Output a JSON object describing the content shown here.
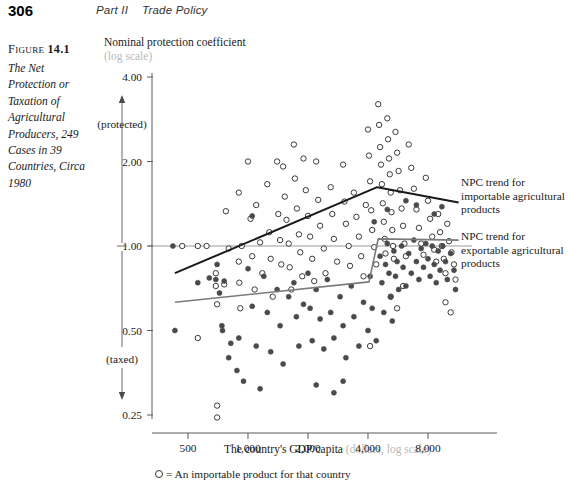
{
  "header": {
    "page_number": "306",
    "part": "Part II",
    "section": "Trade Policy"
  },
  "figure": {
    "label_prefix": "Figure",
    "label_number": "14.1",
    "caption": "The Net Protection or Taxation of Agricultural Producers, 249 Cases in 39 Countries, Circa 1980"
  },
  "annotations": {
    "importable_trend": "NPC trend for importable agricultural products",
    "exportable_trend": "NPC trend for exportable agricultural products"
  },
  "legend": {
    "marker": "open-circle",
    "text": "= An importable product for that country"
  },
  "axis_direction": {
    "top_label": "(protected)",
    "bottom_label": "(taxed)"
  },
  "chart_data": {
    "type": "scatter",
    "title": "The Net Protection or Taxation of Agricultural Producers, 249 Cases in 39 Countries, Circa 1980",
    "xlabel": "The country's GDP/capita",
    "xlabel_sub": "(dollars, log scale)",
    "ylabel": "Nominal protection coefficient",
    "ylabel_sub": "(log scale)",
    "xscale": "log",
    "yscale": "log",
    "xlim": [
      330,
      13000
    ],
    "ylim": [
      0.22,
      4.3
    ],
    "xticks": [
      500,
      1000,
      2000,
      4000,
      8000
    ],
    "xticklabels": [
      "500",
      "1,000",
      "2,000",
      "4,000",
      "8,000"
    ],
    "yticks": [
      0.25,
      0.5,
      1.0,
      2.0,
      4.0
    ],
    "yticklabels": [
      "0.25",
      "0.50",
      "1.00",
      "2.00",
      "4.00"
    ],
    "grid": false,
    "reference_line_y": 1.0,
    "n_cases": 249,
    "n_countries": 39,
    "series": [
      {
        "name": "Importable product for that country",
        "marker": "open-circle",
        "color": "#3a3a3a",
        "points": [
          [
            468,
            1.0
          ],
          [
            560,
            1.0
          ],
          [
            620,
            1.0
          ],
          [
            690,
            0.72
          ],
          [
            690,
            0.8
          ],
          [
            700,
            0.62
          ],
          [
            760,
            0.73
          ],
          [
            775,
            1.33
          ],
          [
            560,
            0.47
          ],
          [
            700,
            0.27
          ],
          [
            800,
            0.98
          ],
          [
            900,
            1.55
          ],
          [
            900,
            0.88
          ],
          [
            905,
            0.74
          ],
          [
            915,
            0.6
          ],
          [
            930,
            1.0
          ],
          [
            1000,
            2.0
          ],
          [
            1030,
            1.25
          ],
          [
            1050,
            0.92
          ],
          [
            1080,
            0.7
          ],
          [
            1100,
            1.4
          ],
          [
            1150,
            1.03
          ],
          [
            1180,
            0.8
          ],
          [
            1250,
            1.66
          ],
          [
            1280,
            1.12
          ],
          [
            1300,
            0.9
          ],
          [
            1330,
            0.66
          ],
          [
            1400,
            2.0
          ],
          [
            1420,
            1.3
          ],
          [
            1450,
            1.05
          ],
          [
            1470,
            0.86
          ],
          [
            1500,
            1.92
          ],
          [
            1530,
            1.5
          ],
          [
            1560,
            1.24
          ],
          [
            1600,
            1.02
          ],
          [
            1620,
            0.84
          ],
          [
            1650,
            0.7
          ],
          [
            1700,
            2.3
          ],
          [
            1720,
            1.74
          ],
          [
            1760,
            1.36
          ],
          [
            1800,
            1.1
          ],
          [
            1830,
            0.95
          ],
          [
            1870,
            0.78
          ],
          [
            1900,
            2.05
          ],
          [
            1950,
            1.58
          ],
          [
            2000,
            1.28
          ],
          [
            2050,
            1.08
          ],
          [
            2100,
            0.9
          ],
          [
            2150,
            0.75
          ],
          [
            2200,
            2.0
          ],
          [
            2250,
            1.46
          ],
          [
            2300,
            1.18
          ],
          [
            2400,
            0.98
          ],
          [
            2450,
            0.8
          ],
          [
            2600,
            1.62
          ],
          [
            2650,
            1.3
          ],
          [
            2700,
            1.06
          ],
          [
            2800,
            0.88
          ],
          [
            3000,
            1.95
          ],
          [
            3050,
            1.44
          ],
          [
            3100,
            1.2
          ],
          [
            3200,
            1.0
          ],
          [
            3250,
            0.85
          ],
          [
            3400,
            1.55
          ],
          [
            3500,
            1.27
          ],
          [
            3600,
            1.08
          ],
          [
            3700,
            0.92
          ],
          [
            3800,
            0.78
          ],
          [
            3900,
            1.4
          ],
          [
            4000,
            2.6
          ],
          [
            4050,
            2.1
          ],
          [
            4100,
            1.7
          ],
          [
            4150,
            1.34
          ],
          [
            4200,
            1.14
          ],
          [
            4300,
            0.99
          ],
          [
            4400,
            0.86
          ],
          [
            4500,
            3.2
          ],
          [
            4550,
            2.7
          ],
          [
            4600,
            2.25
          ],
          [
            4650,
            1.95
          ],
          [
            4700,
            1.66
          ],
          [
            4750,
            1.42
          ],
          [
            4800,
            1.22
          ],
          [
            4850,
            1.06
          ],
          [
            4900,
            0.94
          ],
          [
            5000,
            2.85
          ],
          [
            5050,
            2.4
          ],
          [
            5100,
            2.05
          ],
          [
            5150,
            1.8
          ],
          [
            5200,
            1.55
          ],
          [
            5250,
            1.32
          ],
          [
            5300,
            1.14
          ],
          [
            5350,
            1.0
          ],
          [
            5400,
            0.9
          ],
          [
            5500,
            2.55
          ],
          [
            5600,
            2.15
          ],
          [
            5700,
            1.85
          ],
          [
            5800,
            1.58
          ],
          [
            5900,
            1.36
          ],
          [
            6000,
            1.18
          ],
          [
            6100,
            1.02
          ],
          [
            6200,
            0.92
          ],
          [
            6400,
            2.3
          ],
          [
            6600,
            1.9
          ],
          [
            6800,
            1.6
          ],
          [
            7000,
            1.35
          ],
          [
            7200,
            1.16
          ],
          [
            7400,
            1.02
          ],
          [
            7600,
            0.93
          ],
          [
            7800,
            1.75
          ],
          [
            8000,
            1.45
          ],
          [
            8200,
            1.25
          ],
          [
            8400,
            1.08
          ],
          [
            8600,
            0.97
          ],
          [
            8800,
            0.88
          ],
          [
            9000,
            1.3
          ],
          [
            9200,
            1.12
          ],
          [
            9400,
            1.0
          ],
          [
            9600,
            0.9
          ],
          [
            9800,
            0.8
          ],
          [
            10000,
            1.2
          ],
          [
            10200,
            1.04
          ],
          [
            10500,
            0.95
          ],
          [
            10800,
            0.86
          ],
          [
            11000,
            0.76
          ],
          [
            700,
            0.245
          ],
          [
            5200,
            0.66
          ],
          [
            5600,
            0.6
          ],
          [
            4100,
            0.44
          ],
          [
            6000,
            0.72
          ],
          [
            9800,
            0.63
          ],
          [
            10400,
            0.58
          ]
        ]
      },
      {
        "name": "Exportable product for that country",
        "marker": "filled-circle",
        "color": "#4a4a4a",
        "points": [
          [
            420,
            1.0
          ],
          [
            430,
            0.5
          ],
          [
            560,
            0.74
          ],
          [
            640,
            0.77
          ],
          [
            690,
            0.76
          ],
          [
            700,
            0.86
          ],
          [
            720,
            0.68
          ],
          [
            740,
            0.52
          ],
          [
            745,
            0.5
          ],
          [
            760,
            0.75
          ],
          [
            800,
            0.4
          ],
          [
            820,
            0.45
          ],
          [
            880,
            0.36
          ],
          [
            900,
            0.47
          ],
          [
            950,
            0.33
          ],
          [
            1000,
            0.83
          ],
          [
            1050,
            0.61
          ],
          [
            1100,
            0.44
          ],
          [
            1150,
            0.31
          ],
          [
            1200,
            0.78
          ],
          [
            1250,
            0.58
          ],
          [
            1300,
            0.42
          ],
          [
            1400,
            0.7
          ],
          [
            1450,
            0.52
          ],
          [
            1500,
            0.38
          ],
          [
            1600,
            0.66
          ],
          [
            1700,
            0.74
          ],
          [
            1750,
            0.56
          ],
          [
            1800,
            0.44
          ],
          [
            1900,
            0.62
          ],
          [
            2000,
            0.8
          ],
          [
            2050,
            0.6
          ],
          [
            2100,
            0.46
          ],
          [
            2200,
            0.7
          ],
          [
            2300,
            0.55
          ],
          [
            2400,
            0.43
          ],
          [
            2500,
            0.76
          ],
          [
            2600,
            0.58
          ],
          [
            2700,
            0.47
          ],
          [
            2900,
            0.66
          ],
          [
            3000,
            0.52
          ],
          [
            3100,
            0.4
          ],
          [
            3300,
            0.72
          ],
          [
            3400,
            0.56
          ],
          [
            3600,
            0.44
          ],
          [
            3800,
            0.63
          ],
          [
            4000,
            0.5
          ],
          [
            4100,
            0.78
          ],
          [
            4200,
            0.6
          ],
          [
            4400,
            0.46
          ],
          [
            4600,
            0.92
          ],
          [
            4700,
            0.74
          ],
          [
            4800,
            0.58
          ],
          [
            4900,
            0.86
          ],
          [
            5000,
            1.02
          ],
          [
            5100,
            0.8
          ],
          [
            5200,
            0.66
          ],
          [
            5300,
            0.54
          ],
          [
            5400,
            0.96
          ],
          [
            5500,
            0.78
          ],
          [
            5600,
            0.88
          ],
          [
            5700,
            0.7
          ],
          [
            5900,
            1.0
          ],
          [
            6000,
            0.84
          ],
          [
            6200,
            0.72
          ],
          [
            6400,
            0.94
          ],
          [
            6600,
            0.8
          ],
          [
            6800,
            1.05
          ],
          [
            7000,
            0.88
          ],
          [
            7200,
            0.76
          ],
          [
            7400,
            0.98
          ],
          [
            7600,
            0.84
          ],
          [
            7800,
            1.02
          ],
          [
            8000,
            0.9
          ],
          [
            8200,
            0.78
          ],
          [
            8400,
            1.0
          ],
          [
            8600,
            0.86
          ],
          [
            8800,
            0.74
          ],
          [
            9000,
            0.96
          ],
          [
            9200,
            0.82
          ],
          [
            9500,
            1.0
          ],
          [
            9800,
            0.88
          ],
          [
            10000,
            0.76
          ],
          [
            10400,
            0.94
          ],
          [
            10800,
            0.82
          ],
          [
            11000,
            0.7
          ],
          [
            1050,
            1.28
          ],
          [
            4300,
            1.22
          ],
          [
            5000,
            1.35
          ],
          [
            6200,
            1.45
          ],
          [
            7000,
            1.4
          ],
          [
            8600,
            1.3
          ],
          [
            9400,
            1.38
          ],
          [
            2700,
            0.3
          ],
          [
            3000,
            0.33
          ],
          [
            2200,
            0.32
          ]
        ]
      }
    ],
    "trend_lines": [
      {
        "name": "NPC trend for importable agricultural products",
        "color": "#1a1a1a",
        "width": 2,
        "points": [
          [
            430,
            0.8
          ],
          [
            4450,
            1.62
          ],
          [
            11400,
            1.43
          ]
        ]
      },
      {
        "name": "NPC trend for exportable agricultural products",
        "color": "#7a7a7a",
        "width": 1.6,
        "points": [
          [
            430,
            0.63
          ],
          [
            4050,
            0.745
          ],
          [
            4500,
            1.06
          ],
          [
            11400,
            1.05
          ]
        ]
      }
    ]
  }
}
